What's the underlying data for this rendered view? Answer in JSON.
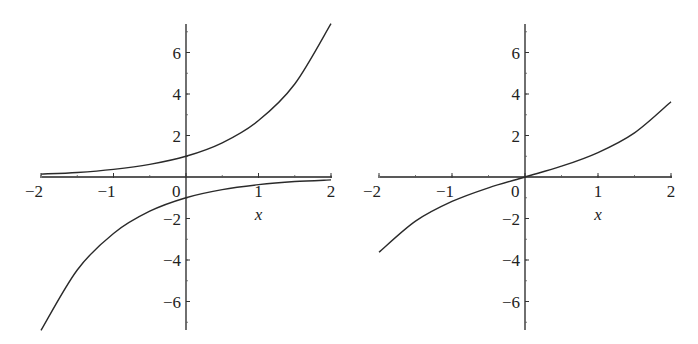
{
  "chart_data": [
    {
      "type": "line",
      "title": "",
      "xlabel": "x",
      "ylabel": "",
      "xlim": [
        -2,
        2
      ],
      "ylim": [
        -7.4,
        7.4
      ],
      "grid": false,
      "legend": null,
      "x_ticks": [
        -2,
        -1,
        0,
        1,
        2
      ],
      "x_tick_labels": [
        "−2",
        "−1",
        "0",
        "1",
        "2"
      ],
      "y_ticks": [
        -6,
        -4,
        -2,
        2,
        4,
        6
      ],
      "y_tick_labels": [
        "−6",
        "−4",
        "−2",
        "2",
        "4",
        "6"
      ],
      "series": [
        {
          "name": "e^x",
          "x": [
            -2,
            -1.5,
            -1,
            -0.5,
            0,
            0.5,
            1,
            1.5,
            2
          ],
          "y": [
            0.14,
            0.22,
            0.37,
            0.61,
            1.0,
            1.65,
            2.72,
            4.48,
            7.39
          ]
        },
        {
          "name": "-e^(-x)",
          "x": [
            -2,
            -1.5,
            -1,
            -0.5,
            0,
            0.5,
            1,
            1.5,
            2
          ],
          "y": [
            -7.39,
            -4.48,
            -2.72,
            -1.65,
            -1.0,
            -0.61,
            -0.37,
            -0.22,
            -0.14
          ]
        }
      ]
    },
    {
      "type": "line",
      "title": "",
      "xlabel": "x",
      "ylabel": "",
      "xlim": [
        -2,
        2
      ],
      "ylim": [
        -7.4,
        7.4
      ],
      "grid": false,
      "legend": null,
      "x_ticks": [
        -2,
        -1,
        0,
        1,
        2
      ],
      "x_tick_labels": [
        "−2",
        "−1",
        "0",
        "1",
        "2"
      ],
      "y_ticks": [
        -6,
        -4,
        -2,
        2,
        4,
        6
      ],
      "y_tick_labels": [
        "−6",
        "−4",
        "−2",
        "2",
        "4",
        "6"
      ],
      "series": [
        {
          "name": "sinh(x)",
          "x": [
            -2,
            -1.5,
            -1,
            -0.5,
            0,
            0.5,
            1,
            1.5,
            2
          ],
          "y": [
            -3.63,
            -2.13,
            -1.18,
            -0.52,
            0.0,
            0.52,
            1.18,
            2.13,
            3.63
          ]
        }
      ]
    }
  ],
  "plots": [
    {
      "origin_px": [
        186,
        177
      ],
      "x_left_px": 42,
      "x_right_px": 332,
      "px_per_unit_y": 20.75,
      "y_top_px": 24,
      "y_bottom_px": 330
    },
    {
      "origin_px": [
        525,
        177
      ],
      "x_left_px": 380,
      "x_right_px": 672,
      "px_per_unit_y": 20.75,
      "y_top_px": 24,
      "y_bottom_px": 330
    }
  ]
}
